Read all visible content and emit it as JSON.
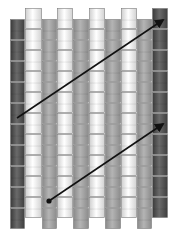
{
  "diagram": {
    "type": "bead-weave-pattern",
    "width": 174,
    "height": 241,
    "bead_height": 21,
    "colors": {
      "dark": "#4a4a4a",
      "mid": "#9a9a9a",
      "light": "#f0f0f0",
      "arrow": "#111111",
      "background": "#ffffff",
      "bead_border": "#7a7a7a"
    },
    "columns": [
      {
        "x": 10,
        "w": 15,
        "tone": "dark",
        "top": 19,
        "bottom": 229
      },
      {
        "x": 25,
        "w": 17,
        "tone": "light",
        "top": 8,
        "bottom": 219
      },
      {
        "x": 42,
        "w": 15,
        "tone": "mid",
        "top": 19,
        "bottom": 229
      },
      {
        "x": 57,
        "w": 16,
        "tone": "light",
        "top": 8,
        "bottom": 219
      },
      {
        "x": 73,
        "w": 16,
        "tone": "mid",
        "top": 19,
        "bottom": 229
      },
      {
        "x": 89,
        "w": 16,
        "tone": "light",
        "top": 8,
        "bottom": 219
      },
      {
        "x": 105,
        "w": 16,
        "tone": "mid",
        "top": 19,
        "bottom": 229
      },
      {
        "x": 121,
        "w": 16,
        "tone": "light",
        "top": 8,
        "bottom": 219
      },
      {
        "x": 137,
        "w": 15,
        "tone": "mid",
        "top": 19,
        "bottom": 229
      },
      {
        "x": 152,
        "w": 16,
        "tone": "dark",
        "top": 8,
        "bottom": 219
      }
    ],
    "arrows": [
      {
        "name": "upper-arrow",
        "x1": 17,
        "y1": 118,
        "x2": 163,
        "y2": 20,
        "start_dot": false
      },
      {
        "name": "lower-arrow",
        "x1": 49,
        "y1": 201,
        "x2": 163,
        "y2": 124,
        "start_dot": true
      }
    ]
  }
}
